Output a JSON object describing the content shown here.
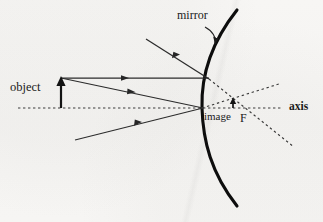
{
  "diagram": {
    "labels": {
      "object": "object",
      "mirror": "mirror",
      "image": "image",
      "focal_point": "F",
      "axis": "axis"
    },
    "colors": {
      "paper": "#f6f5f3",
      "ink": "#1a1a1a",
      "ray": "#2b2b2b",
      "mirror": "#111111",
      "dashed": "#3a3a3a"
    },
    "geometry": {
      "axis_y": 108,
      "axis_x_start": 18,
      "axis_x_end": 283,
      "object_x": 61,
      "object_top_y": 78,
      "mirror_vertex": [
        202,
        108
      ],
      "mirror_top": [
        237,
        10
      ],
      "mirror_bottom": [
        237,
        206
      ],
      "focal_point": [
        237,
        104
      ],
      "image_x": 233,
      "image_top_y": 99
    },
    "elements": [
      {
        "name": "mirror-arc",
        "kind": "curve",
        "描述": "concave mirror, thick black arc bulging right"
      },
      {
        "name": "principal-axis",
        "kind": "dashed-line"
      },
      {
        "name": "object-arrow",
        "kind": "arrow-up"
      },
      {
        "name": "incident-ray-parallel",
        "kind": "ray",
        "direction": "rightward"
      },
      {
        "name": "incident-ray-to-vertex",
        "kind": "ray",
        "direction": "rightward"
      },
      {
        "name": "reflected-ray-upper",
        "kind": "ray",
        "direction": "up-left"
      },
      {
        "name": "reflected-ray-lower",
        "kind": "ray",
        "direction": "down-left"
      },
      {
        "name": "virtual-ray-upper",
        "kind": "dashed-line"
      },
      {
        "name": "virtual-ray-lower",
        "kind": "dashed-line"
      },
      {
        "name": "image-arrow",
        "kind": "arrow-up-small"
      },
      {
        "name": "mirror-pointer",
        "kind": "curved-arrow"
      }
    ]
  }
}
